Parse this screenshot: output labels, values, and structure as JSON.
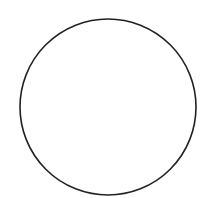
{
  "canvas": {
    "width": 210,
    "height": 198,
    "background": "#ffffff"
  },
  "shape": {
    "type": "circle",
    "cx": 108,
    "cy": 107,
    "r": 88,
    "stroke": "#222222",
    "stroke_width": 1.6,
    "fill": "none"
  }
}
